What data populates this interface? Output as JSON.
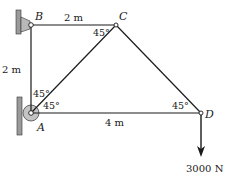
{
  "diagram": {
    "type": "truss",
    "nodes": [
      {
        "id": "A",
        "label": "A",
        "support": "pin-to-wall"
      },
      {
        "id": "B",
        "label": "B",
        "support": "pin-to-wall"
      },
      {
        "id": "C",
        "label": "C"
      },
      {
        "id": "D",
        "label": "D"
      }
    ],
    "members": [
      {
        "from": "B",
        "to": "C"
      },
      {
        "from": "A",
        "to": "B"
      },
      {
        "from": "A",
        "to": "C"
      },
      {
        "from": "C",
        "to": "D"
      },
      {
        "from": "A",
        "to": "D"
      }
    ],
    "dimensions": {
      "bc": "2 m",
      "ab": "2 m",
      "ad": "4 m"
    },
    "angles": {
      "c_angle": "45°",
      "a_upper": "45°",
      "a_lower": "45°",
      "d_angle": "45°"
    },
    "load": {
      "at": "D",
      "direction": "down",
      "label": "3000 N"
    },
    "colors": {
      "line": "#1a1a1a",
      "wall_fill": "#9a9a9a",
      "support_fill": "#b8b8b8"
    }
  }
}
